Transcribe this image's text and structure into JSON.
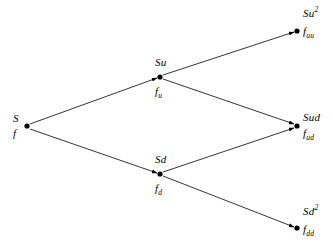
{
  "diagram": {
    "type": "binomial-tree",
    "background_color": "#ffffff",
    "line_color": "#000000",
    "node_color": "#000000",
    "nodes": [
      {
        "id": "root",
        "asset": "S",
        "asset_sup": "",
        "option": "f",
        "option_sub": "",
        "x": 27,
        "y": 126,
        "label_x": 13,
        "asset_y": 113,
        "option_y": 128
      },
      {
        "id": "up",
        "asset": "Su",
        "asset_sup": "",
        "option": "f",
        "option_sub": "u",
        "x": 160,
        "y": 77,
        "label_x": 155,
        "asset_y": 57,
        "option_y": 86
      },
      {
        "id": "down",
        "asset": "Sd",
        "asset_sup": "",
        "option": "f",
        "option_sub": "d",
        "x": 160,
        "y": 174,
        "label_x": 155,
        "asset_y": 154,
        "option_y": 183
      },
      {
        "id": "upup",
        "asset": "Su",
        "asset_sup": "2",
        "option": "f",
        "option_sub": "uu",
        "x": 297,
        "y": 31,
        "label_x": 303,
        "asset_y": 8,
        "option_y": 26
      },
      {
        "id": "updown",
        "asset": "Sud",
        "asset_sup": "",
        "option": "f",
        "option_sub": "ud",
        "x": 297,
        "y": 126,
        "label_x": 303,
        "asset_y": 112,
        "option_y": 128
      },
      {
        "id": "downdown",
        "asset": "Sd",
        "asset_sup": "2",
        "option": "f",
        "option_sub": "dd",
        "x": 297,
        "y": 228,
        "label_x": 303,
        "asset_y": 206,
        "option_y": 224
      }
    ],
    "edges": [
      {
        "id": "root-up",
        "from": "root",
        "to": "up",
        "x1": 30,
        "y1": 124,
        "x2": 157,
        "y2": 78
      },
      {
        "id": "root-down",
        "from": "root",
        "to": "down",
        "x1": 30,
        "y1": 129,
        "x2": 157,
        "y2": 173
      },
      {
        "id": "up-upup",
        "from": "up",
        "to": "upup",
        "x1": 163,
        "y1": 75,
        "x2": 294,
        "y2": 32
      },
      {
        "id": "up-updown",
        "from": "up",
        "to": "updown",
        "x1": 163,
        "y1": 79,
        "x2": 294,
        "y2": 124
      },
      {
        "id": "down-updown",
        "from": "down",
        "to": "updown",
        "x1": 163,
        "y1": 172,
        "x2": 294,
        "y2": 128
      },
      {
        "id": "down-downdown",
        "from": "down",
        "to": "downdown",
        "x1": 163,
        "y1": 176,
        "x2": 294,
        "y2": 227
      }
    ]
  }
}
